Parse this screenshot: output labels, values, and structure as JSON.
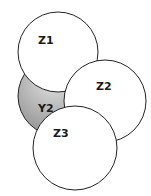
{
  "diagram": {
    "type": "overlapping-circles",
    "circles": [
      {
        "id": "Y2",
        "label": "Y2",
        "fill": "#b8b8b8",
        "cx": 58,
        "cy": 96,
        "r": 40
      },
      {
        "id": "Z1",
        "label": "Z1",
        "fill": "#ffffff",
        "cx": 58,
        "cy": 52,
        "r": 40
      },
      {
        "id": "Z2",
        "label": "Z2",
        "fill": "#ffffff",
        "cx": 105,
        "cy": 101,
        "r": 41
      },
      {
        "id": "Z3",
        "label": "Z3",
        "fill": "#ffffff",
        "cx": 75,
        "cy": 148,
        "r": 42
      }
    ],
    "stroke": "#222222"
  }
}
